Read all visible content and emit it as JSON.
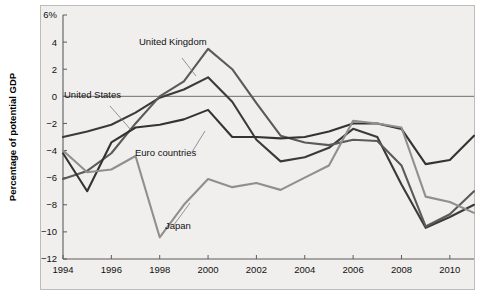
{
  "figure": {
    "background_color": "#f0efed",
    "page_color": "#ffffff",
    "y_axis_title": "Percentage of potential GDP"
  },
  "axes": {
    "y_ticks": [
      "6%",
      "4",
      "2",
      "0",
      "−2",
      "−4",
      "−6",
      "−8",
      "−10",
      "−12"
    ],
    "y_tick_values": [
      6,
      4,
      2,
      0,
      -2,
      -4,
      -6,
      -8,
      -10,
      -12
    ],
    "x_ticks": [
      "1994",
      "1996",
      "1998",
      "2000",
      "2002",
      "2004",
      "2006",
      "2008",
      "2010"
    ],
    "x_tick_values": [
      1994,
      1996,
      1998,
      2000,
      2002,
      2004,
      2006,
      2008,
      2010
    ]
  },
  "annotations": [
    {
      "label": "United Kingdom",
      "x": 139,
      "y": 45
    },
    {
      "label": "United States",
      "x": 64,
      "y": 98
    },
    {
      "label": "Euro countries",
      "x": 135,
      "y": 156
    },
    {
      "label": "Japan",
      "x": 165,
      "y": 229
    }
  ],
  "chart_data": {
    "type": "line",
    "title": "",
    "subtitle": "",
    "xlabel": "",
    "ylabel": "Percentage of potential GDP",
    "xlim": [
      1994,
      2011
    ],
    "ylim": [
      -12,
      6
    ],
    "grid": false,
    "legend_position": "inline-annotations",
    "zero_line": true,
    "x": [
      1994,
      1995,
      1996,
      1997,
      1998,
      1999,
      2000,
      2001,
      2002,
      2003,
      2004,
      2005,
      2006,
      2007,
      2008,
      2009,
      2010,
      2011
    ],
    "series": [
      {
        "name": "United States",
        "color": "#3a3a3a",
        "values": [
          -3.0,
          -2.6,
          -2.1,
          -1.2,
          -0.1,
          0.5,
          1.4,
          -0.4,
          -3.2,
          -4.8,
          -4.5,
          -3.8,
          -2.4,
          -3.0,
          -6.5,
          -9.7,
          -8.9,
          -8.0
        ]
      },
      {
        "name": "United Kingdom",
        "color": "#5a5a5a",
        "values": [
          -6.1,
          -5.5,
          -4.2,
          -2.0,
          0.0,
          1.1,
          3.5,
          2.0,
          -0.5,
          -2.9,
          -3.4,
          -3.6,
          -3.2,
          -3.3,
          -5.1,
          -9.6,
          -8.7,
          -7.0
        ]
      },
      {
        "name": "Euro countries",
        "color": "#333333",
        "values": [
          -4.2,
          -7.0,
          -3.4,
          -2.3,
          -2.1,
          -1.7,
          -1.0,
          -3.0,
          -3.0,
          -3.1,
          -3.0,
          -2.6,
          -2.0,
          -2.0,
          -2.4,
          -5.0,
          -4.7,
          -2.9
        ]
      },
      {
        "name": "Japan",
        "color": "#8f8f8f",
        "values": [
          -4.0,
          -5.6,
          -5.4,
          -4.4,
          -10.4,
          -8.0,
          -6.1,
          -6.7,
          -6.4,
          -6.9,
          -6.0,
          -5.1,
          -1.8,
          -2.0,
          -2.3,
          -7.4,
          -7.8,
          -8.6
        ]
      }
    ]
  }
}
